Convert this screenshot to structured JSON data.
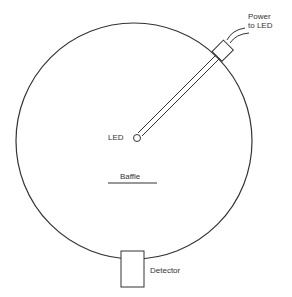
{
  "diagram": {
    "labels": {
      "power_line1": "Power",
      "power_line2": "to LED",
      "led": "LED",
      "baffle": "Baffle",
      "detector": "Detector"
    },
    "colors": {
      "stroke": "#333333",
      "background": "#ffffff"
    }
  }
}
